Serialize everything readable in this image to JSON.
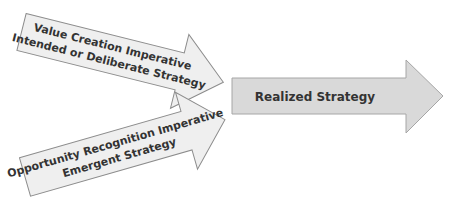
{
  "diagram": {
    "type": "strategy-flow",
    "arrows": [
      {
        "id": "value-creation",
        "lines": [
          "Value Creation Imperative",
          "Intended or Deliberate Strategy"
        ],
        "fill": "#efefef",
        "stroke": "#8c8c8c"
      },
      {
        "id": "opportunity-recognition",
        "lines": [
          "Opportunity Recognition Imperative",
          "Emergent Strategy"
        ],
        "fill": "#efefef",
        "stroke": "#8c8c8c"
      },
      {
        "id": "realized",
        "lines": [
          "Realized Strategy"
        ],
        "fill": "#d9d9d9",
        "stroke": "#a6a6a6"
      }
    ],
    "text_color": "#333333"
  }
}
